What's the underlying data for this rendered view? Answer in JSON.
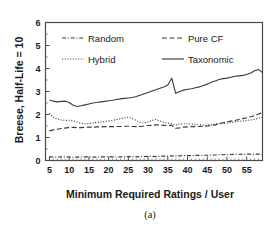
{
  "figure": {
    "caption": "(a)"
  },
  "chart_data": {
    "type": "line",
    "title": "",
    "xlabel": "Minimum Required Ratings / User",
    "ylabel": "Breese, Half-Life = 10",
    "xlim": [
      4,
      59
    ],
    "ylim": [
      0,
      6
    ],
    "xticks": [
      5,
      10,
      15,
      20,
      25,
      30,
      35,
      40,
      45,
      50,
      55
    ],
    "yticks": [
      0,
      1,
      2,
      3,
      4,
      5,
      6
    ],
    "grid": false,
    "legend_position": "upper-left-inside",
    "x": [
      5,
      6,
      7,
      8,
      9,
      10,
      11,
      12,
      13,
      14,
      15,
      16,
      17,
      18,
      19,
      20,
      21,
      22,
      23,
      24,
      25,
      26,
      27,
      28,
      29,
      30,
      31,
      32,
      33,
      34,
      35,
      36,
      37,
      38,
      39,
      40,
      41,
      42,
      43,
      44,
      45,
      46,
      47,
      48,
      49,
      50,
      51,
      52,
      53,
      54,
      55,
      56,
      57,
      58,
      59
    ],
    "series": [
      {
        "name": "Random",
        "style": "dash-dot",
        "values": [
          0.16,
          0.15,
          0.15,
          0.16,
          0.16,
          0.15,
          0.14,
          0.15,
          0.15,
          0.16,
          0.16,
          0.15,
          0.15,
          0.16,
          0.16,
          0.17,
          0.16,
          0.15,
          0.16,
          0.16,
          0.17,
          0.17,
          0.16,
          0.17,
          0.17,
          0.18,
          0.18,
          0.17,
          0.18,
          0.19,
          0.19,
          0.2,
          0.2,
          0.2,
          0.21,
          0.21,
          0.21,
          0.22,
          0.22,
          0.23,
          0.23,
          0.24,
          0.24,
          0.25,
          0.25,
          0.26,
          0.26,
          0.27,
          0.27,
          0.28,
          0.28,
          0.28,
          0.28,
          0.28,
          0.27
        ]
      },
      {
        "name": "Pure CF",
        "style": "dashed",
        "values": [
          1.29,
          1.33,
          1.36,
          1.39,
          1.41,
          1.44,
          1.44,
          1.43,
          1.43,
          1.44,
          1.45,
          1.45,
          1.46,
          1.46,
          1.47,
          1.47,
          1.47,
          1.48,
          1.48,
          1.49,
          1.49,
          1.48,
          1.47,
          1.48,
          1.5,
          1.52,
          1.53,
          1.55,
          1.54,
          1.53,
          1.52,
          1.53,
          1.4,
          1.42,
          1.45,
          1.46,
          1.47,
          1.47,
          1.48,
          1.49,
          1.5,
          1.52,
          1.55,
          1.6,
          1.64,
          1.68,
          1.71,
          1.74,
          1.78,
          1.82,
          1.86,
          1.9,
          1.95,
          2.02,
          2.08
        ]
      },
      {
        "name": "Hybrid",
        "style": "dotted",
        "values": [
          2.06,
          1.88,
          1.8,
          1.76,
          1.74,
          1.75,
          1.72,
          1.68,
          1.62,
          1.6,
          1.6,
          1.63,
          1.66,
          1.68,
          1.7,
          1.72,
          1.74,
          1.78,
          1.82,
          1.86,
          1.88,
          1.82,
          1.74,
          1.66,
          1.62,
          1.68,
          1.74,
          1.78,
          1.72,
          1.66,
          1.62,
          1.6,
          1.54,
          1.58,
          1.6,
          1.6,
          1.58,
          1.56,
          1.55,
          1.54,
          1.54,
          1.56,
          1.58,
          1.6,
          1.62,
          1.63,
          1.65,
          1.68,
          1.7,
          1.72,
          1.74,
          1.76,
          1.79,
          1.84,
          1.88
        ]
      },
      {
        "name": "Taxonomic",
        "style": "solid",
        "values": [
          2.63,
          2.58,
          2.55,
          2.57,
          2.58,
          2.52,
          2.4,
          2.35,
          2.38,
          2.42,
          2.46,
          2.5,
          2.52,
          2.55,
          2.57,
          2.6,
          2.62,
          2.65,
          2.68,
          2.7,
          2.72,
          2.74,
          2.78,
          2.84,
          2.9,
          2.96,
          3.02,
          3.08,
          3.14,
          3.2,
          3.28,
          3.58,
          2.92,
          3.0,
          3.06,
          3.1,
          3.12,
          3.16,
          3.2,
          3.26,
          3.32,
          3.4,
          3.46,
          3.52,
          3.56,
          3.58,
          3.62,
          3.66,
          3.68,
          3.7,
          3.74,
          3.8,
          3.9,
          3.96,
          3.82
        ]
      }
    ]
  },
  "legend": {
    "items": [
      {
        "label": "Random",
        "style": "dash-dot"
      },
      {
        "label": "Pure CF",
        "style": "dashed"
      },
      {
        "label": "Hybrid",
        "style": "dotted"
      },
      {
        "label": "Taxonomic",
        "style": "solid"
      }
    ]
  }
}
